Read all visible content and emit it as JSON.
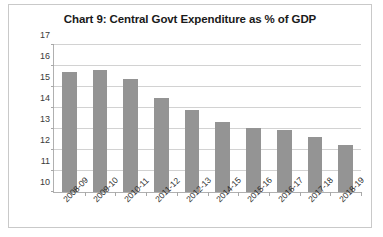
{
  "chart_data": {
    "type": "bar",
    "title": "Chart 9: Central Govt Expenditure as % of GDP",
    "xlabel": "",
    "ylabel": "",
    "ylim": [
      10,
      17
    ],
    "ytick_step": 1,
    "yticks": [
      10,
      11,
      12,
      13,
      14,
      15,
      16,
      17
    ],
    "grid": true,
    "legend": false,
    "bar_color": "#949494",
    "categories": [
      "2008-09",
      "2009-10",
      "2010-11",
      "2011-12",
      "2012-13",
      "2014-15",
      "2015-16",
      "2016-17",
      "2017-18",
      "2018-19"
    ],
    "values": [
      15.7,
      15.8,
      15.4,
      14.5,
      13.9,
      13.35,
      13.05,
      12.95,
      12.6,
      12.25
    ]
  }
}
